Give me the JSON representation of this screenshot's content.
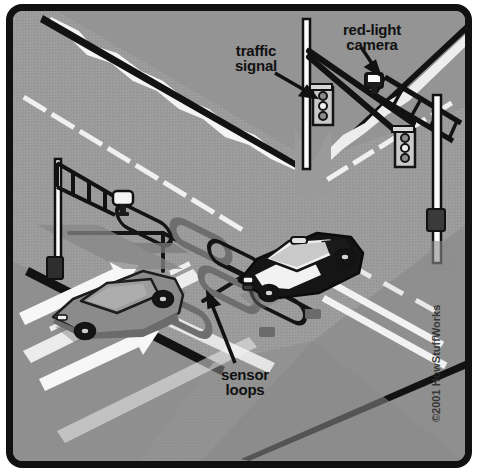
{
  "illustration": {
    "title": "Red-light camera intersection diagram",
    "copyright": "©2001 HowStuffWorks",
    "labels": {
      "traffic_signal": "traffic\nsignal",
      "red_light_camera": "red-light\ncamera",
      "sensor_loops": "sensor\nloops"
    },
    "icons": {
      "traffic_signal": "traffic-signal-icon",
      "camera": "camera-icon",
      "sensor_loop": "sensor-loop-icon",
      "car": "car-icon",
      "arrow": "lane-arrow-icon",
      "pointer": "leader-line-icon"
    },
    "colors": {
      "border": "#111111",
      "asphalt": "#9a9a9a",
      "asphalt_dark": "#8d8d8d",
      "sidewalk": "#a3a3a3",
      "lane_marking": "#f2f2f2",
      "ink": "#111111",
      "loop": "#6f6f6f",
      "pole": "#ffffff",
      "car_dark": "#1a1a1a",
      "car_light": "#8a8a8a",
      "shadow": "#7d7d7d"
    },
    "scene": {
      "vehicles": [
        {
          "name": "sedan-left",
          "body": "light-gray",
          "heading": "east"
        },
        {
          "name": "police-car-center",
          "body": "black-and-white",
          "heading": "east"
        }
      ],
      "signals_count": 2,
      "cameras_count": 2,
      "sensor_loops_count": 3,
      "lane_arrows_count": 2
    }
  }
}
